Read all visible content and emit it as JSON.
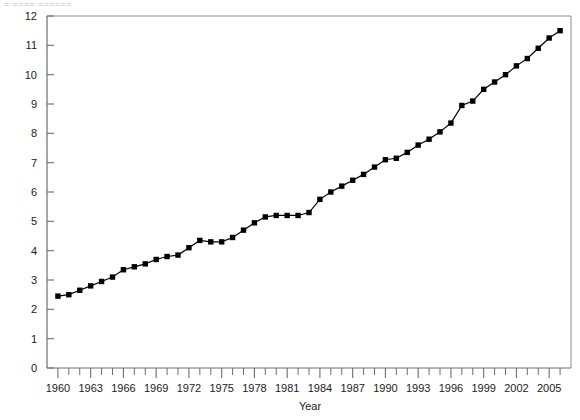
{
  "top_text_fragment": "= ====  ======",
  "chart_data": {
    "type": "line",
    "title": "",
    "subtitle": "",
    "xlabel": "Year",
    "ylabel": "",
    "xlim": [
      1959,
      2007
    ],
    "ylim": [
      0,
      12
    ],
    "grid": false,
    "legend": false,
    "marker": "square",
    "line_color": "#000000",
    "marker_color": "#000000",
    "y_ticks": [
      0,
      1,
      2,
      3,
      4,
      5,
      6,
      7,
      8,
      9,
      10,
      11,
      12
    ],
    "y_tick_labels": [
      "0",
      "1",
      "2",
      "3",
      "4",
      "5",
      "6",
      "7",
      "8",
      "9",
      "10",
      "11",
      "12"
    ],
    "x_ticks": [
      1960,
      1961,
      1962,
      1963,
      1964,
      1965,
      1966,
      1967,
      1968,
      1969,
      1970,
      1971,
      1972,
      1973,
      1974,
      1975,
      1976,
      1977,
      1978,
      1979,
      1980,
      1981,
      1982,
      1983,
      1984,
      1985,
      1986,
      1987,
      1988,
      1989,
      1990,
      1991,
      1992,
      1993,
      1994,
      1995,
      1996,
      1997,
      1998,
      1999,
      2000,
      2001,
      2002,
      2003,
      2004,
      2005,
      2006
    ],
    "x_tick_labels_shown": [
      "1960",
      "1963",
      "1966",
      "1969",
      "1972",
      "1975",
      "1978",
      "1981",
      "1984",
      "1987",
      "1990",
      "1993",
      "1996",
      "1999",
      "2002",
      "2005"
    ],
    "x_label_interval": 3,
    "x": [
      1960,
      1961,
      1962,
      1963,
      1964,
      1965,
      1966,
      1967,
      1968,
      1969,
      1970,
      1971,
      1972,
      1973,
      1974,
      1975,
      1976,
      1977,
      1978,
      1979,
      1980,
      1981,
      1982,
      1983,
      1984,
      1985,
      1986,
      1987,
      1988,
      1989,
      1990,
      1991,
      1992,
      1993,
      1994,
      1995,
      1996,
      1997,
      1998,
      1999,
      2000,
      2001,
      2002,
      2003,
      2004,
      2005,
      2006
    ],
    "values": [
      2.45,
      2.5,
      2.65,
      2.8,
      2.95,
      3.1,
      3.35,
      3.45,
      3.55,
      3.7,
      3.8,
      3.85,
      4.1,
      4.35,
      4.3,
      4.3,
      4.45,
      4.7,
      4.95,
      5.15,
      5.2,
      5.2,
      5.2,
      5.3,
      5.75,
      6.0,
      6.2,
      6.4,
      6.6,
      6.85,
      7.1,
      7.15,
      7.35,
      7.6,
      7.8,
      8.05,
      8.35,
      8.95,
      9.1,
      9.5,
      9.75,
      10.0,
      10.3,
      10.55,
      10.9,
      11.25,
      11.5
    ],
    "series": [
      {
        "name": "series-1",
        "values": [
          2.45,
          2.5,
          2.65,
          2.8,
          2.95,
          3.1,
          3.35,
          3.45,
          3.55,
          3.7,
          3.8,
          3.85,
          4.1,
          4.35,
          4.3,
          4.3,
          4.45,
          4.7,
          4.95,
          5.15,
          5.2,
          5.2,
          5.2,
          5.3,
          5.75,
          6.0,
          6.2,
          6.4,
          6.6,
          6.85,
          7.1,
          7.15,
          7.35,
          7.6,
          7.8,
          8.05,
          8.35,
          8.95,
          9.1,
          9.5,
          9.75,
          10.0,
          10.3,
          10.55,
          10.9,
          11.25,
          11.5
        ]
      }
    ]
  }
}
